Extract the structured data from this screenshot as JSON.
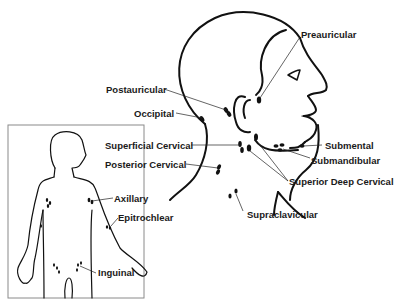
{
  "diagram": {
    "head_labels": {
      "preauricular": "Preauricular",
      "postauricular": "Postauricular",
      "occipital": "Occipital",
      "superficial_cervical": "Superficial Cervical",
      "posterior_cervical": "Posterior Cervical",
      "submental": "Submental",
      "submandibular": "Submandibular",
      "superior_deep_cervical": "Superior Deep Cervical",
      "supraclavicular": "Supraclavicular"
    },
    "body_labels": {
      "axillary": "Axillary",
      "epitrochlear": "Epitrochlear",
      "inguinal": "Inguinal"
    },
    "colors": {
      "line": "#111111",
      "background": "#ffffff",
      "inset_border": "#8a8a8a"
    }
  }
}
